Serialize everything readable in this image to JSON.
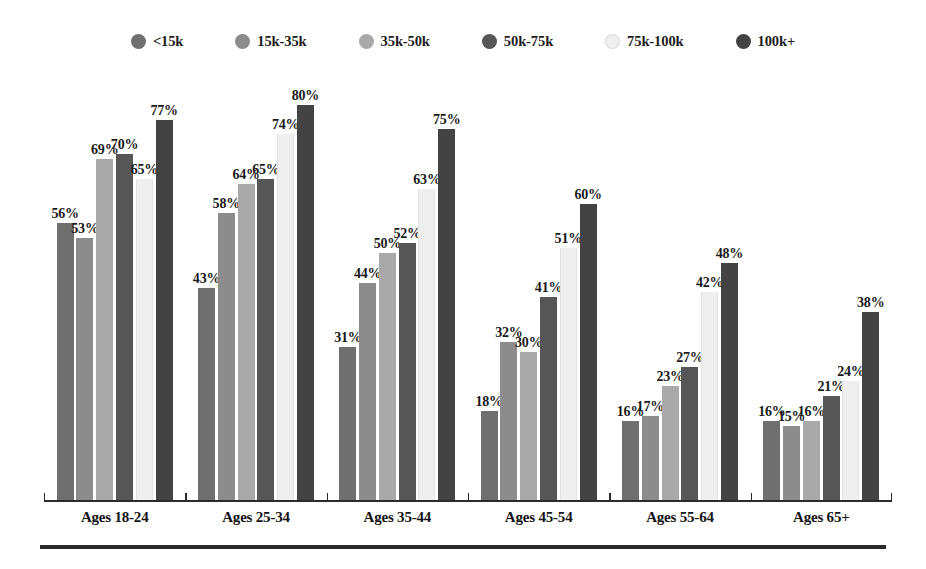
{
  "chart_data": {
    "type": "bar",
    "title": "",
    "subtitle": "",
    "xlabel": "",
    "ylabel": "",
    "ylim": [
      0,
      85
    ],
    "grid": false,
    "legend_position": "top-center",
    "value_suffix": "%",
    "categories": [
      "Ages 18-24",
      "Ages 25-34",
      "Ages 35-44",
      "Ages 45-54",
      "Ages 55-64",
      "Ages 65+"
    ],
    "series": [
      {
        "name": "<15k",
        "color": "#6f6f6f",
        "values": [
          56,
          43,
          31,
          18,
          16,
          16
        ]
      },
      {
        "name": "15k-35k",
        "color": "#8c8c8c",
        "values": [
          53,
          58,
          44,
          32,
          17,
          15
        ]
      },
      {
        "name": "35k-50k",
        "color": "#a9a9a9",
        "values": [
          69,
          64,
          50,
          30,
          23,
          16
        ]
      },
      {
        "name": "50k-75k",
        "color": "#565656",
        "values": [
          70,
          65,
          52,
          41,
          27,
          21
        ]
      },
      {
        "name": "75k-100k",
        "color": "#efefef",
        "values": [
          65,
          74,
          63,
          51,
          42,
          24
        ]
      },
      {
        "name": "100k+",
        "color": "#434343",
        "values": [
          77,
          80,
          75,
          60,
          48,
          38
        ]
      }
    ],
    "labels": [
      [
        "56%",
        "53%",
        "69%",
        "70%",
        "65%",
        "77%"
      ],
      [
        "43%",
        "58%",
        "64%",
        "65%",
        "74%",
        "80%"
      ],
      [
        "31%",
        "44%",
        "50%",
        "52%",
        "63%",
        "75%"
      ],
      [
        "18%",
        "32%",
        "30%",
        "41%",
        "51%",
        "60%"
      ],
      [
        "16%",
        "17%",
        "23%",
        "27%",
        "42%",
        "48%"
      ],
      [
        "16%",
        "15%",
        "16%",
        "21%",
        "24%",
        "38%"
      ]
    ]
  },
  "legend": {
    "items": [
      {
        "label": "<15k",
        "color": "#6f6f6f"
      },
      {
        "label": "15k-35k",
        "color": "#8c8c8c"
      },
      {
        "label": "35k-50k",
        "color": "#a9a9a9"
      },
      {
        "label": "50k-75k",
        "color": "#565656"
      },
      {
        "label": "75k-100k",
        "color": "#efefef"
      },
      {
        "label": "100k+",
        "color": "#434343"
      }
    ]
  },
  "axis": {
    "baseline_color": "#2b2b2b",
    "rule_color": "#2a2a2a"
  }
}
